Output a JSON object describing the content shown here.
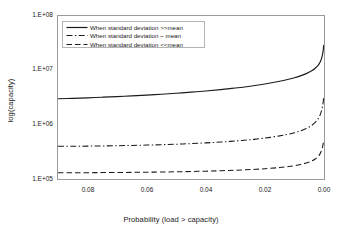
{
  "chart_data": {
    "type": "line",
    "title": "",
    "xlabel": "Probability (load > capacity)",
    "ylabel": "log(capacity)",
    "xlim": [
      0.09,
      0.0
    ],
    "ylim": [
      100000,
      100000000
    ],
    "yscale": "log",
    "x_reversed": true,
    "grid": false,
    "xticks": [
      "0.08",
      "0.06",
      "0.04",
      "0.02",
      "0.00"
    ],
    "xtick_values": [
      0.08,
      0.06,
      0.04,
      0.02,
      0.0
    ],
    "yticks": [
      "1.E+08",
      "1.E+07",
      "1.E+06",
      "1.E+05"
    ],
    "ytick_values": [
      100000000,
      10000000,
      1000000,
      100000
    ],
    "legend_position": "upper left inside axes",
    "series": [
      {
        "name": "When standard deviation >>mean",
        "style": "solid",
        "color": "#1a1a1a",
        "x": [
          0.09,
          0.085,
          0.08,
          0.075,
          0.07,
          0.065,
          0.06,
          0.055,
          0.05,
          0.045,
          0.04,
          0.035,
          0.03,
          0.025,
          0.02,
          0.015,
          0.012,
          0.01,
          0.008,
          0.006,
          0.004,
          0.003,
          0.002,
          0.0015,
          0.001,
          0.0006,
          0.0003,
          0.0001
        ],
        "values": [
          3000000,
          3050000,
          3120000,
          3200000,
          3290000,
          3390000,
          3500000,
          3630000,
          3780000,
          3960000,
          4170000,
          4420000,
          4720000,
          5100000,
          5600000,
          6300000,
          6850000,
          7300000,
          7900000,
          8700000,
          9900000,
          10900000,
          12400000,
          13600000,
          15500000,
          18500000,
          22500000,
          29000000
        ]
      },
      {
        "name": "When standard deviation ~ mean",
        "style": "dashdot",
        "color": "#1a1a1a",
        "x": [
          0.09,
          0.085,
          0.08,
          0.075,
          0.07,
          0.065,
          0.06,
          0.055,
          0.05,
          0.045,
          0.04,
          0.035,
          0.03,
          0.025,
          0.02,
          0.015,
          0.012,
          0.01,
          0.008,
          0.006,
          0.004,
          0.003,
          0.002,
          0.0015,
          0.001,
          0.0006,
          0.0003,
          0.0001
        ],
        "values": [
          400000,
          401000,
          403000,
          406000,
          410000,
          415000,
          421000,
          428000,
          437000,
          448000,
          462000,
          479000,
          500000,
          528000,
          566000,
          622000,
          670000,
          712000,
          770000,
          850000,
          985000,
          1100000,
          1280000,
          1430000,
          1680000,
          2060000,
          2550000,
          3150000
        ]
      },
      {
        "name": "When standard deviation <<mean",
        "style": "dashed",
        "color": "#1a1a1a",
        "x": [
          0.09,
          0.085,
          0.08,
          0.075,
          0.07,
          0.065,
          0.06,
          0.055,
          0.05,
          0.045,
          0.04,
          0.035,
          0.03,
          0.025,
          0.02,
          0.015,
          0.012,
          0.01,
          0.008,
          0.006,
          0.004,
          0.003,
          0.002,
          0.0015,
          0.001,
          0.0006,
          0.0003,
          0.0001
        ],
        "values": [
          130000,
          130300,
          130700,
          131200,
          131800,
          132500,
          133400,
          134500,
          135800,
          137400,
          139400,
          141900,
          145000,
          149000,
          154500,
          162500,
          169500,
          176000,
          185000,
          197000,
          216000,
          233000,
          259000,
          281000,
          317000,
          372000,
          440000,
          520000
        ]
      }
    ]
  },
  "legend": {
    "entries": [
      {
        "label": "When standard deviation >>mean",
        "style": "solid"
      },
      {
        "label": "When standard deviation ~ mean",
        "style": "dashdot"
      },
      {
        "label": "When standard deviation <<mean",
        "style": "dashed"
      }
    ]
  },
  "axes": {
    "x_title": "Probability (load > capacity)",
    "y_title": "log(capacity)",
    "y_labels": [
      "1.E+08",
      "1.E+07",
      "1.E+06",
      "1.E+05"
    ],
    "x_labels": [
      "0.08",
      "0.06",
      "0.04",
      "0.02",
      "0.00"
    ]
  },
  "colors": {
    "line": "#1a1a1a",
    "frame": "#9a9a9a",
    "legend_border": "#b4b4b4",
    "background": "#ffffff"
  }
}
